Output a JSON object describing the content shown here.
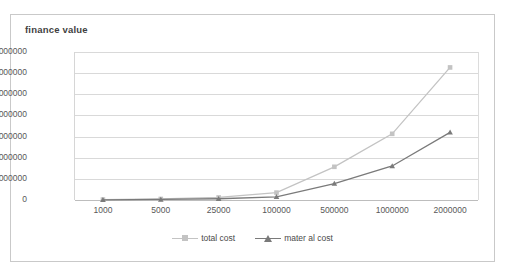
{
  "chart_data": {
    "type": "line",
    "title": "finance value",
    "xlabel": "",
    "ylabel": "",
    "categories": [
      "1000",
      "5000",
      "25000",
      "100000",
      "500000",
      "1000000",
      "2000000"
    ],
    "series": [
      {
        "name": "total cost",
        "color": "#c3c3c3",
        "marker": "square",
        "values": [
          20000,
          50000,
          120000,
          350000,
          1570000,
          3130000,
          6270000
        ]
      },
      {
        "name": "mater al cost",
        "color": "#7a7a7a",
        "marker": "triangle",
        "values": [
          10000,
          25000,
          60000,
          150000,
          780000,
          1610000,
          3200000
        ]
      }
    ],
    "ylim": [
      0,
      7000000
    ],
    "yticks": [
      "0",
      "1000000",
      "2000000",
      "3000000",
      "4000000",
      "5000000",
      "6000000",
      "7000000"
    ],
    "ytick_values": [
      0,
      1000000,
      2000000,
      3000000,
      4000000,
      5000000,
      6000000,
      7000000
    ],
    "grid": true,
    "legend_position": "bottom"
  },
  "legend": {
    "items": [
      {
        "label": "total cost"
      },
      {
        "label": "mater al cost"
      }
    ]
  },
  "colors": {
    "total_cost": "#c3c3c3",
    "material_cost": "#7a7a7a",
    "grid": "#d9d9d9",
    "border": "#c9c9c9",
    "text": "#585858"
  }
}
